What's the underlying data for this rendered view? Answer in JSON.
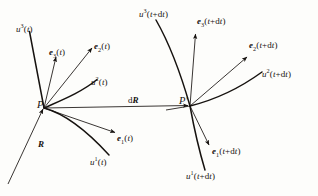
{
  "figure": {
    "background_color": "#fdfdfb",
    "stroke_color": "#16120f",
    "points": [
      {
        "id": "P",
        "label": "P",
        "x": 44,
        "y": 108
      },
      {
        "id": "Pp",
        "label": "P′",
        "x": 190,
        "y": 106
      }
    ],
    "labels": {
      "u3_t": {
        "text_html": "<i>u</i><sup>3</sup>(<i>t</i>)",
        "plain": "u3(t)",
        "x": 16,
        "y": 25
      },
      "e3_t": {
        "text_html": "<b>e</b><sub>3</sub>(<i>t</i>)",
        "plain": "e3(t)",
        "x": 49,
        "y": 48
      },
      "e2_t": {
        "text_html": "<b>e</b><sub>2</sub>(<i>t</i>)",
        "plain": "e2(t)",
        "x": 94,
        "y": 42
      },
      "u2_t": {
        "text_html": "<i>u</i><sup>2</sup>(<i>t</i>)",
        "plain": "u2(t)",
        "x": 91,
        "y": 78
      },
      "dR": {
        "text_html": "d<b>R</b>",
        "plain": "dR",
        "x": 128,
        "y": 96
      },
      "e1_t": {
        "text_html": "<b>e</b><sub>1</sub>(<i>t</i>)",
        "plain": "e1(t)",
        "x": 117,
        "y": 134
      },
      "u1_t": {
        "text_html": "<i>u</i><sup>1</sup>(<i>t</i>)",
        "plain": "u1(t)",
        "x": 90,
        "y": 158
      },
      "R": {
        "text_html": "<b>R</b>",
        "plain": "R",
        "x": 38,
        "y": 140
      },
      "u3_tdt": {
        "text_html": "<i>u</i><sup>3</sup>(<i>t</i>+d<i>t</i>)",
        "plain": "u3(t+dt)",
        "x": 139,
        "y": 10
      },
      "e3_tdt": {
        "text_html": "<b>e</b><sub>3</sub>(<i>t</i>+d<i>t</i>)",
        "plain": "e3(t+dt)",
        "x": 197,
        "y": 17
      },
      "e2_tdt": {
        "text_html": "<b>e</b><sub>2</sub>(<i>t</i>+d<i>t</i>)",
        "plain": "e2(t+dt)",
        "x": 249,
        "y": 41
      },
      "u2_tdt": {
        "text_html": "<i>u</i><sup>2</sup>(<i>t</i>+d<i>t</i>)",
        "plain": "u2(t+dt)",
        "x": 262,
        "y": 70
      },
      "e1_tdt": {
        "text_html": "<b>e</b><sub>1</sub>(<i>t</i>+d<i>t</i>)",
        "plain": "e1(t+dt)",
        "x": 212,
        "y": 147
      },
      "u1_tdt": {
        "text_html": "<i>u</i><sup>1</sup>(<i>t</i>+d<i>t</i>)",
        "plain": "u1(t+dt)",
        "x": 186,
        "y": 172
      }
    }
  },
  "chart_data": {
    "type": "diagram",
    "frames": [
      {
        "origin": "P",
        "origin_xy": [
          44,
          108
        ],
        "basis_vectors": [
          {
            "name": "e1(t)",
            "tip_xy": [
              115,
              133
            ]
          },
          {
            "name": "e2(t)",
            "tip_xy": [
              92,
              48
            ]
          },
          {
            "name": "e3(t)",
            "tip_xy": [
              56,
              57
            ]
          }
        ],
        "coordinate_curves": [
          {
            "name": "u1(t)",
            "end_xy": [
              108,
              156
            ]
          },
          {
            "name": "u2(t)",
            "end_xy": [
              96,
              80
            ]
          },
          {
            "name": "u3(t)",
            "end_xy": [
              29,
              31
            ]
          }
        ]
      },
      {
        "origin": "P′",
        "origin_xy": [
          190,
          106
        ],
        "basis_vectors": [
          {
            "name": "e1(t+dt)",
            "tip_xy": [
              210,
              146
            ]
          },
          {
            "name": "e2(t+dt)",
            "tip_xy": [
              248,
              57
            ]
          },
          {
            "name": "e3(t+dt)",
            "tip_xy": [
              196,
              34
            ]
          }
        ],
        "coordinate_curves": [
          {
            "name": "u1(t+dt)",
            "end_xy": [
              205,
              170
            ]
          },
          {
            "name": "u2(t+dt)",
            "end_xy": [
              262,
              72
            ]
          },
          {
            "name": "u3(t+dt)",
            "end_xy": [
              155,
              20
            ]
          }
        ]
      }
    ],
    "connectors": [
      {
        "name": "dR",
        "from_xy": [
          44,
          108
        ],
        "to_xy": [
          190,
          106
        ]
      },
      {
        "name": "R",
        "from_xy": [
          8,
          183
        ],
        "to_xy": [
          44,
          108
        ]
      }
    ]
  }
}
